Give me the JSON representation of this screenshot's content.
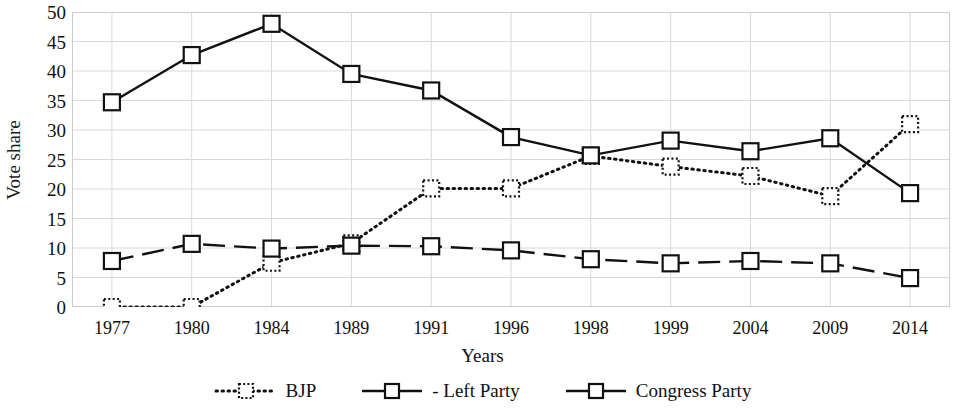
{
  "chart_data": {
    "type": "line",
    "title": "",
    "xlabel": "Years",
    "ylabel": "Vote share",
    "categories": [
      "1977",
      "1980",
      "1984",
      "1989",
      "1991",
      "1996",
      "1998",
      "1999",
      "2004",
      "2009",
      "2014"
    ],
    "ylim": [
      0,
      50
    ],
    "yticks": [
      0,
      5,
      10,
      15,
      20,
      25,
      30,
      35,
      40,
      45,
      50
    ],
    "grid": true,
    "legend_position": "bottom",
    "series": [
      {
        "name": "BJP",
        "legend_label": "BJP",
        "line_style": "dotted",
        "marker": "dotted-square",
        "color": "#111111",
        "values": [
          0,
          0,
          7.5,
          10.8,
          20.1,
          20.1,
          25.6,
          23.8,
          22.2,
          18.8,
          31.0
        ]
      },
      {
        "name": "Left Party",
        "legend_label": "- Left Party",
        "line_style": "dashed",
        "marker": "square",
        "color": "#111111",
        "values": [
          7.8,
          10.7,
          9.9,
          10.4,
          10.3,
          9.6,
          8.1,
          7.4,
          7.8,
          7.4,
          4.9
        ]
      },
      {
        "name": "Congress Party",
        "legend_label": "Congress Party",
        "line_style": "solid",
        "marker": "square",
        "color": "#111111",
        "values": [
          34.7,
          42.7,
          48.0,
          39.5,
          36.7,
          28.8,
          25.7,
          28.2,
          26.4,
          28.6,
          19.3
        ]
      }
    ]
  }
}
